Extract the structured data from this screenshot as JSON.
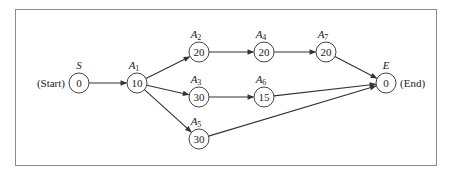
{
  "diagram": {
    "type": "activity-network",
    "nodes": [
      {
        "id": "S",
        "label": "S",
        "sub": "",
        "value": "0",
        "x": 79,
        "y": 83,
        "side_label": "(Start)",
        "side": "left"
      },
      {
        "id": "A1",
        "label": "A",
        "sub": "1",
        "value": "10",
        "x": 137,
        "y": 83
      },
      {
        "id": "A2",
        "label": "A",
        "sub": "2",
        "value": "20",
        "x": 199,
        "y": 52
      },
      {
        "id": "A3",
        "label": "A",
        "sub": "3",
        "value": "30",
        "x": 199,
        "y": 97
      },
      {
        "id": "A5",
        "label": "A",
        "sub": "5",
        "value": "30",
        "x": 199,
        "y": 139
      },
      {
        "id": "A4",
        "label": "A",
        "sub": "4",
        "value": "20",
        "x": 264,
        "y": 52
      },
      {
        "id": "A6",
        "label": "A",
        "sub": "6",
        "value": "15",
        "x": 264,
        "y": 97
      },
      {
        "id": "A7",
        "label": "A",
        "sub": "7",
        "value": "20",
        "x": 326,
        "y": 52
      },
      {
        "id": "E",
        "label": "E",
        "sub": "",
        "value": "0",
        "x": 386,
        "y": 83,
        "side_label": "(End)",
        "side": "right"
      }
    ],
    "edges": [
      {
        "from": "S",
        "to": "A1"
      },
      {
        "from": "A1",
        "to": "A2"
      },
      {
        "from": "A1",
        "to": "A3"
      },
      {
        "from": "A1",
        "to": "A5"
      },
      {
        "from": "A2",
        "to": "A4"
      },
      {
        "from": "A4",
        "to": "A7"
      },
      {
        "from": "A3",
        "to": "A6"
      },
      {
        "from": "A7",
        "to": "E"
      },
      {
        "from": "A6",
        "to": "E"
      },
      {
        "from": "A5",
        "to": "E"
      }
    ],
    "node_radius": 10,
    "colors": {
      "stroke": "#333333",
      "frame": "#8a8a8a",
      "background": "#ffffff"
    }
  }
}
